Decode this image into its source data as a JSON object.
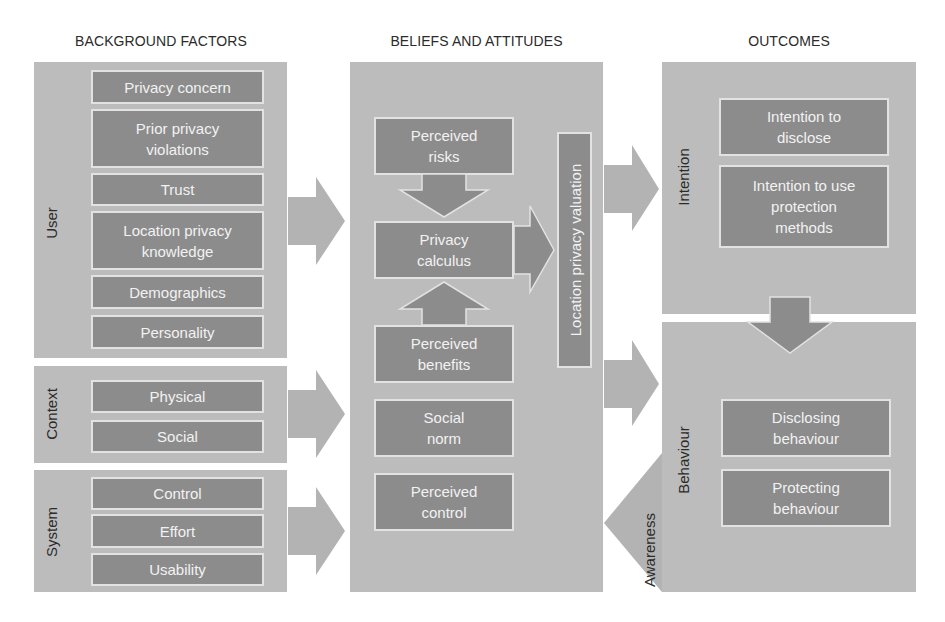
{
  "headings": {
    "background": "BACKGROUND FACTORS",
    "beliefs": "BELIEFS AND ATTITUDES",
    "outcomes": "OUTCOMES"
  },
  "background_factors": {
    "user": {
      "label": "User",
      "items": [
        "Privacy concern",
        "Prior privacy\nviolations",
        "Trust",
        "Location privacy\nknowledge",
        "Demographics",
        "Personality"
      ]
    },
    "context": {
      "label": "Context",
      "items": [
        "Physical",
        "Social"
      ]
    },
    "system": {
      "label": "System",
      "items": [
        "Control",
        "Effort",
        "Usability"
      ]
    }
  },
  "beliefs_and_attitudes": {
    "items": [
      "Perceived\nrisks",
      "Privacy\ncalculus",
      "Perceived\nbenefits",
      "Social\nnorm",
      "Perceived\ncontrol"
    ],
    "valuation_label": "Location privacy valuation"
  },
  "outcomes": {
    "intention": {
      "label": "Intention",
      "items": [
        "Intention to\ndisclose",
        "Intention to use\nprotection\nmethods"
      ]
    },
    "behaviour": {
      "label": "Behaviour",
      "items": [
        "Disclosing\nbehaviour",
        "Protecting\nbehaviour"
      ]
    },
    "feedback_label": "Awareness"
  },
  "colors": {
    "panel": "#bcbcbc",
    "box": "#8c8c8c",
    "box_border": "#e2e2e2",
    "arrow": "#b3b3b3",
    "arrow_dark": "#8c8c8c"
  }
}
